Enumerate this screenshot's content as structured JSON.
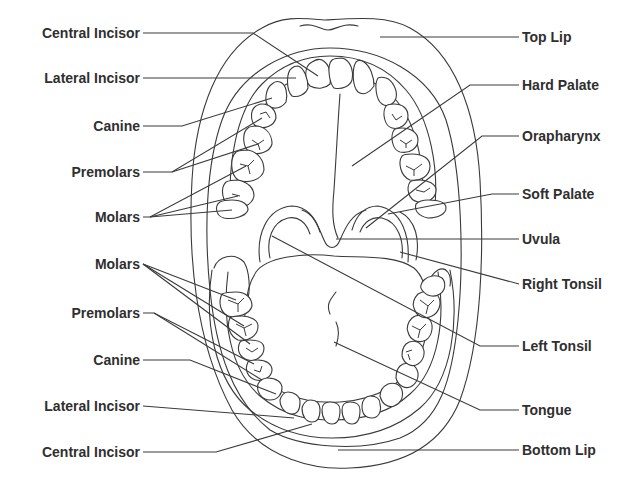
{
  "colors": {
    "line": "#3a3a3a",
    "text": "#2f2f2f",
    "background": "#ffffff"
  },
  "labels": {
    "left": [
      {
        "id": "central-incisor-upper",
        "text": "Central Incisor"
      },
      {
        "id": "lateral-incisor-upper",
        "text": "Lateral Incisor"
      },
      {
        "id": "canine-upper",
        "text": "Canine"
      },
      {
        "id": "premolars-upper",
        "text": "Premolars"
      },
      {
        "id": "molars-upper",
        "text": "Molars"
      },
      {
        "id": "molars-lower",
        "text": "Molars"
      },
      {
        "id": "premolars-lower",
        "text": "Premolars"
      },
      {
        "id": "canine-lower",
        "text": "Canine"
      },
      {
        "id": "lateral-incisor-lower",
        "text": "Lateral Incisor"
      },
      {
        "id": "central-incisor-lower",
        "text": "Central Incisor"
      }
    ],
    "right": [
      {
        "id": "top-lip",
        "text": "Top Lip"
      },
      {
        "id": "hard-palate",
        "text": "Hard Palate"
      },
      {
        "id": "orapharynx",
        "text": "Orapharynx"
      },
      {
        "id": "soft-palate",
        "text": "Soft Palate"
      },
      {
        "id": "uvula",
        "text": "Uvula"
      },
      {
        "id": "right-tonsil",
        "text": "Right Tonsil"
      },
      {
        "id": "left-tonsil",
        "text": "Left Tonsil"
      },
      {
        "id": "tongue",
        "text": "Tongue"
      },
      {
        "id": "bottom-lip",
        "text": "Bottom Lip"
      }
    ]
  }
}
